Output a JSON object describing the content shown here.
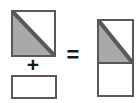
{
  "diagram": {
    "type": "geometric-decomposition",
    "background_color": "#ffffff",
    "outline_color": "#595959",
    "shaded_color": "#a9a9a9",
    "unshaded_color": "#ffffff",
    "operators": {
      "plus": "+",
      "equals": "="
    },
    "operands": [
      {
        "name": "square-with-diagonal",
        "shape": "square",
        "description": "Square divided by a diagonal from top-left to bottom-right; lower-left triangle shaded gray, upper-right triangle white",
        "shaded_region": "lower-left-triangle",
        "fill": "#a9a9a9",
        "x": 11,
        "y": 10,
        "width": 45,
        "height": 47
      },
      {
        "name": "plain-rectangle",
        "shape": "rectangle",
        "description": "Unshaded white rectangle, wider than tall",
        "shaded_region": "none",
        "fill": "#ffffff",
        "x": 11,
        "y": 75,
        "width": 46,
        "height": 24
      }
    ],
    "result": {
      "name": "stacked-composite",
      "shape": "rectangle",
      "description": "Tall rectangle: the square with its gray diagonal triangle stacked on top of the white rectangle",
      "x": 97,
      "y": 19,
      "width": 37,
      "height": 78,
      "divider_offset": 43,
      "parts": [
        {
          "name": "result-upper-square",
          "shaded_region": "lower-left-triangle",
          "fill": "#a9a9a9"
        },
        {
          "name": "result-lower-rectangle",
          "shaded_region": "none",
          "fill": "#ffffff"
        }
      ]
    }
  }
}
